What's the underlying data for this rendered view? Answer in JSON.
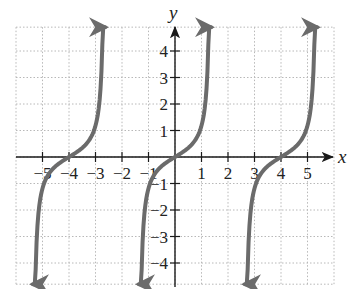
{
  "chart_data": {
    "type": "line",
    "title": "",
    "xlabel": "x",
    "ylabel": "y",
    "xlim": [
      -6,
      6
    ],
    "ylim": [
      -4.8,
      4.9
    ],
    "grid": true,
    "x_ticks": [
      -5,
      -4,
      -3,
      -2,
      -1,
      1,
      2,
      3,
      4,
      5
    ],
    "x_tick_labels": [
      "−5",
      "−4",
      "−3",
      "−2",
      "−1",
      "1",
      "2",
      "3",
      "4",
      "5"
    ],
    "y_ticks": [
      4,
      3,
      2,
      1,
      -1,
      -2,
      -3,
      -4
    ],
    "y_tick_labels": [
      "4",
      "3",
      "2",
      "1",
      "−1",
      "−2",
      "−3",
      "−4"
    ],
    "series": [
      {
        "name": "branch-1",
        "center": -4,
        "x_range": [
          -5.36,
          -2.64
        ],
        "points": [
          [
            -5.36,
            -4.8
          ],
          [
            -5.28,
            -4.0
          ],
          [
            -5.13,
            -2.0
          ],
          [
            -5.06,
            -1.0
          ],
          [
            -4.5,
            -0.3
          ],
          [
            -4,
            0
          ],
          [
            -3.5,
            0.3
          ],
          [
            -2.94,
            1.0
          ],
          [
            -2.87,
            2.0
          ],
          [
            -2.72,
            4.0
          ],
          [
            -2.64,
            4.8
          ]
        ]
      },
      {
        "name": "branch-2",
        "center": 0,
        "x_range": [
          -1.36,
          1.36
        ],
        "points": [
          [
            -1.36,
            -4.8
          ],
          [
            -1.28,
            -4.0
          ],
          [
            -1.13,
            -2.0
          ],
          [
            -0.94,
            -1.0
          ],
          [
            -0.5,
            -0.3
          ],
          [
            0,
            0
          ],
          [
            0.5,
            0.3
          ],
          [
            0.94,
            1.0
          ],
          [
            1.13,
            2.0
          ],
          [
            1.28,
            4.0
          ],
          [
            1.36,
            4.8
          ]
        ]
      },
      {
        "name": "branch-3",
        "center": 4,
        "x_range": [
          2.64,
          5.36
        ],
        "points": [
          [
            2.64,
            -4.8
          ],
          [
            2.72,
            -4.0
          ],
          [
            2.87,
            -2.0
          ],
          [
            3.06,
            -1.0
          ],
          [
            3.5,
            -0.3
          ],
          [
            4,
            0
          ],
          [
            4.5,
            0.3
          ],
          [
            5.06,
            1.0
          ],
          [
            5.13,
            2.0
          ],
          [
            5.28,
            4.0
          ],
          [
            5.36,
            4.8
          ]
        ]
      }
    ],
    "colors": {
      "curve": "#6b6b6b",
      "axis": "#1a1a1a",
      "grid": "#b8b8b8"
    }
  }
}
